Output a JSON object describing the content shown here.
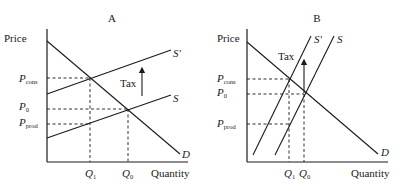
{
  "panels": [
    {
      "id": "A",
      "title": "A",
      "y_axis_label": "Price",
      "x_axis_label": "Quantity",
      "price_labels": [
        {
          "main": "P",
          "sub": "cons"
        },
        {
          "main": "P",
          "sub": "0"
        },
        {
          "main": "P",
          "sub": "prod"
        }
      ],
      "quantity_labels": [
        {
          "main": "Q",
          "sub": "1"
        },
        {
          "main": "Q",
          "sub": "0"
        }
      ],
      "curves": {
        "demand": "D",
        "supply": "S",
        "supply_shifted": "S'"
      },
      "tax_label": "Tax",
      "description": "Elastic supply: tax burden falls mostly on consumers"
    },
    {
      "id": "B",
      "title": "B",
      "y_axis_label": "Price",
      "x_axis_label": "Quantity",
      "price_labels": [
        {
          "main": "P",
          "sub": "cons"
        },
        {
          "main": "P",
          "sub": "0"
        },
        {
          "main": "P",
          "sub": "prod"
        }
      ],
      "quantity_labels": [
        {
          "main": "Q",
          "sub": "1"
        },
        {
          "main": "Q",
          "sub": "0"
        }
      ],
      "curves": {
        "demand": "D",
        "supply": "S",
        "supply_shifted": "S'"
      },
      "tax_label": "Tax",
      "description": "Inelastic supply: tax burden falls mostly on producers"
    }
  ]
}
